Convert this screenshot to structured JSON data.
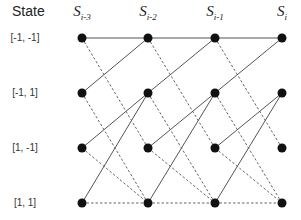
{
  "header": {
    "state_title": "State"
  },
  "columns": [
    {
      "label_base": "S",
      "label_sub": "i-3",
      "x": 82
    },
    {
      "label_base": "S",
      "label_sub": "i-2",
      "x": 148
    },
    {
      "label_base": "S",
      "label_sub": "i-1",
      "x": 215
    },
    {
      "label_base": "S",
      "label_sub": "i",
      "x": 282
    }
  ],
  "states": [
    {
      "label": "[-1, -1]",
      "y": 38
    },
    {
      "label": "[-1, 1]",
      "y": 93
    },
    {
      "label": "[1, -1]",
      "y": 148
    },
    {
      "label": "[1, 1]",
      "y": 203
    }
  ],
  "transitions": [
    {
      "from": 0,
      "to": 0,
      "style": "solid"
    },
    {
      "from": 0,
      "to": 2,
      "style": "dashed"
    },
    {
      "from": 1,
      "to": 0,
      "style": "solid"
    },
    {
      "from": 1,
      "to": 3,
      "style": "dashed"
    },
    {
      "from": 2,
      "to": 1,
      "style": "solid"
    },
    {
      "from": 2,
      "to": 3,
      "style": "dashed"
    },
    {
      "from": 3,
      "to": 1,
      "style": "solid"
    },
    {
      "from": 3,
      "to": 3,
      "style": "dashed"
    }
  ],
  "styles": {
    "line_color": "#555555",
    "node_color": "#111111",
    "node_radius": 4.5
  }
}
